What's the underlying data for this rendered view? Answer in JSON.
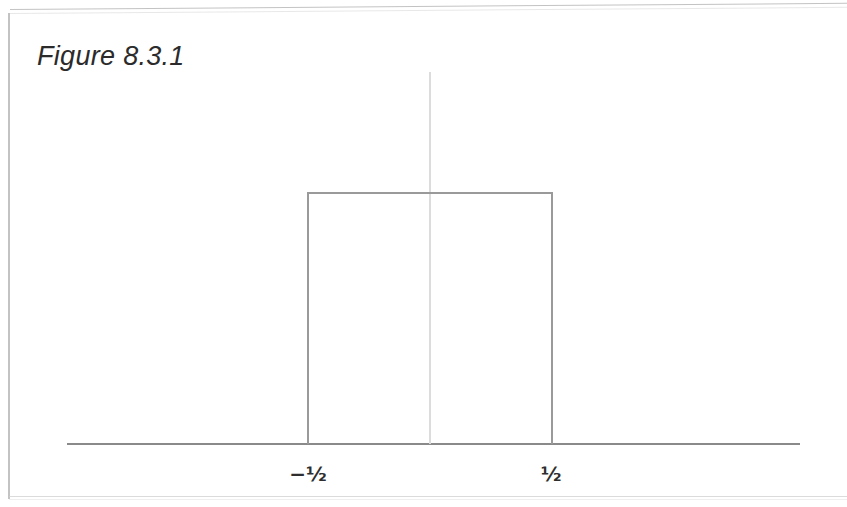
{
  "figure": {
    "title": "Figure 8.3.1",
    "background_color": "#ffffff",
    "frame_color": "#bdbdbd"
  },
  "chart_data": {
    "type": "line",
    "title": "Figure 8.3.1",
    "subtitle": "",
    "xlabel": "",
    "ylabel": "",
    "series": [
      {
        "name": "rect(t)",
        "color": "#9a9a9a",
        "x": [
          -3.0,
          -0.5,
          -0.5,
          0.5,
          0.5,
          3.0
        ],
        "values": [
          0,
          0,
          1,
          1,
          0,
          0
        ]
      }
    ],
    "xlim": [
      -3.0,
      3.0
    ],
    "ylim": [
      0,
      1.35
    ],
    "grid": false,
    "legend": false,
    "legend_position": "none",
    "x_ticks": [
      {
        "value": -0.5,
        "label": "−½"
      },
      {
        "value": 0.5,
        "label": "½"
      }
    ],
    "y_ticks": [],
    "annotations": [
      {
        "text": "Figure 8.3.1",
        "type": "caption"
      }
    ],
    "axes": {
      "horizontal_axis_color": "#8a8a8a",
      "vertical_axis_color": "#dcdcdc",
      "vertical_axis_at_x": 0
    }
  },
  "ticks": {
    "left_label": "−½",
    "right_label": "½"
  }
}
